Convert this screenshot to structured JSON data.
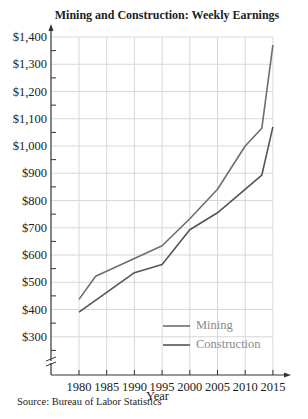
{
  "chart_data": {
    "type": "line",
    "title": "Mining and Construction: Weekly Earnings",
    "xlabel": "Year",
    "ylabel": "",
    "x_ticks": [
      "1980",
      "1985",
      "1990",
      "1995",
      "2000",
      "2005",
      "2010",
      "2015"
    ],
    "y_ticks": [
      "$300",
      "$400",
      "$500",
      "$600",
      "$700",
      "$800",
      "$900",
      "$1,000",
      "$1,100",
      "$1,200",
      "$1,300",
      "$1,400"
    ],
    "ylim": [
      200,
      1400
    ],
    "xlim": [
      1980,
      2015
    ],
    "grid": true,
    "axis_break": true,
    "legend_position": "lower right",
    "series": [
      {
        "name": "Mining",
        "color": "#6e6e6e",
        "x": [
          1980,
          1983,
          1990,
          1995,
          2000,
          2005,
          2010,
          2013,
          2015
        ],
        "values": [
          437,
          522,
          587,
          634,
          733,
          841,
          1000,
          1065,
          1370
        ]
      },
      {
        "name": "Construction",
        "color": "#555555",
        "x": [
          1980,
          1990,
          1995,
          2000,
          2005,
          2013,
          2015
        ],
        "values": [
          390,
          535,
          565,
          693,
          755,
          893,
          1070
        ]
      }
    ],
    "source": "Source: Bureau of Labor Statistics"
  }
}
